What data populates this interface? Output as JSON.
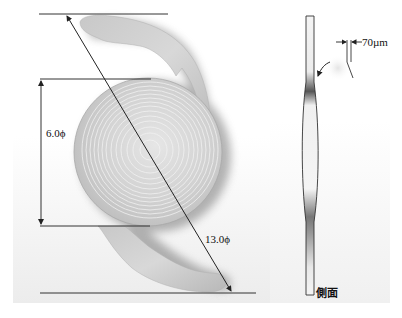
{
  "figure": {
    "front_view": {
      "optic_diameter_label": "6.0ϕ",
      "overall_diameter_label": "13.0ϕ"
    },
    "side_view": {
      "label": "側面",
      "thickness_label": "70µm"
    }
  },
  "colors": {
    "background_panel": "#f2f2f2",
    "lens_body": "#cfcfcf",
    "lens_highlight": "#ececec",
    "lens_shadow": "#8a8a8a",
    "dimension_line": "#333333",
    "text": "#111111"
  }
}
